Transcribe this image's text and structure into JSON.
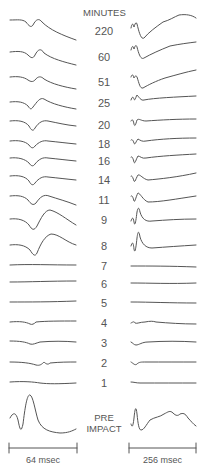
{
  "figure": {
    "column_header": "MINUTES",
    "rows": [
      {
        "label": "220"
      },
      {
        "label": "60"
      },
      {
        "label": "51"
      },
      {
        "label": "25"
      },
      {
        "label": "20"
      },
      {
        "label": "18"
      },
      {
        "label": "16"
      },
      {
        "label": "14"
      },
      {
        "label": "11"
      },
      {
        "label": "9"
      },
      {
        "label": "8"
      },
      {
        "label": "7"
      },
      {
        "label": "6"
      },
      {
        "label": "5"
      },
      {
        "label": "4"
      },
      {
        "label": "3"
      },
      {
        "label": "2"
      },
      {
        "label": "1"
      }
    ],
    "pre_impact_line1": "PRE",
    "pre_impact_line2": "IMPACT",
    "left_scale_label": "64 msec",
    "right_scale_label": "256 msec"
  }
}
